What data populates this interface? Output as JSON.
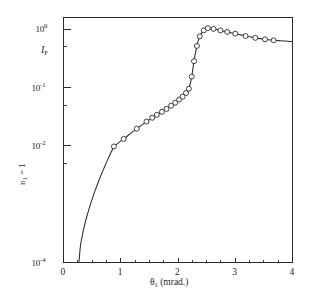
{
  "figure": {
    "background_color": "#ffffff",
    "ink_color": "#2b2b2b"
  },
  "chart_data": {
    "type": "line",
    "title": "",
    "xlabel": "θ₁ (mrad.)",
    "ylabel": "I_F",
    "y_scale": "log",
    "x_scale": "linear",
    "xlim": [
      0,
      4
    ],
    "ylim": [
      0.0001,
      1.6
    ],
    "grid": false,
    "legend": false,
    "xticks": [
      0,
      1,
      2,
      3,
      4
    ],
    "xtick_labels": [
      "0",
      "1",
      "2",
      "3",
      "4"
    ],
    "xminor_ticks": [
      0.25,
      0.5,
      0.75,
      1.25,
      1.5,
      1.75,
      2.25,
      2.5,
      2.75,
      3.25,
      3.5,
      3.75
    ],
    "yticks": [
      1,
      0.1,
      0.01,
      0.0001
    ],
    "ytick_mantissas": [
      "10",
      "10",
      "10",
      "10"
    ],
    "ytick_exponents": [
      "0",
      "-1",
      "-2",
      "-4"
    ],
    "yminor_ticks": [
      0.5,
      0.05,
      0.005
    ],
    "series": [
      {
        "name": "I_F",
        "marker": "open-circle",
        "line": "solid",
        "x": [
          0.88,
          1.05,
          1.28,
          1.45,
          1.55,
          1.63,
          1.72,
          1.8,
          1.88,
          1.95,
          2.02,
          2.08,
          2.14,
          2.19,
          2.24,
          2.28,
          2.33,
          2.38,
          2.45,
          2.52,
          2.62,
          2.74,
          2.86,
          3.0,
          3.18,
          3.35,
          3.52,
          3.67
        ],
        "y": [
          0.0098,
          0.0132,
          0.0198,
          0.0262,
          0.0305,
          0.0342,
          0.0385,
          0.0432,
          0.049,
          0.0552,
          0.0625,
          0.07,
          0.081,
          0.096,
          0.155,
          0.285,
          0.52,
          0.76,
          0.96,
          1.05,
          1.02,
          0.96,
          0.905,
          0.845,
          0.77,
          0.715,
          0.675,
          0.65
        ]
      }
    ],
    "curve_fit": {
      "description": "smooth solid line through the open-circle data points",
      "x_start": 0.27,
      "y_start": 0.0001,
      "x_end": 4.0,
      "y_end": 0.618,
      "peak_x": 2.52,
      "peak_y": 1.05
    }
  },
  "labels": {
    "y_inner": {
      "symbol": "I",
      "subscript": "F"
    },
    "y_outer": {
      "symbol": "n",
      "subscript": "1",
      "equals": " = 1"
    },
    "x_axis": {
      "symbol": "θ",
      "subscript": "1",
      "unit": " (mrad.)"
    }
  }
}
